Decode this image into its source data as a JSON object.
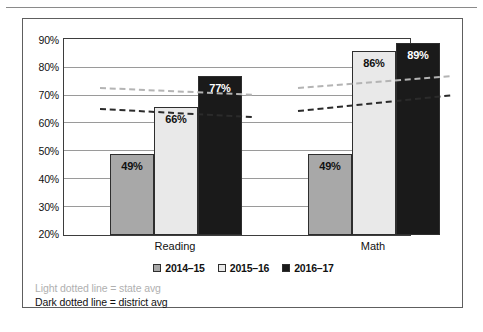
{
  "chart_data": {
    "type": "bar",
    "title": "",
    "xlabel": "",
    "ylabel": "",
    "categories": [
      "Reading",
      "Math"
    ],
    "series": [
      {
        "name": "2014–15",
        "values": [
          49,
          49
        ],
        "color": "#a8a8a8",
        "label_color": "dark"
      },
      {
        "name": "2015–16",
        "values": [
          66,
          86
        ],
        "color": "#e9e9e9",
        "label_color": "dark"
      },
      {
        "name": "2016–17",
        "values": [
          77,
          89
        ],
        "color": "#1a1a1a",
        "label_color": "light"
      }
    ],
    "value_labels": [
      [
        "49%",
        "66%",
        "77%"
      ],
      [
        "49%",
        "86%",
        "89%"
      ]
    ],
    "ylim": [
      20,
      90
    ],
    "ytick_values": [
      20,
      30,
      40,
      50,
      60,
      70,
      80,
      90
    ],
    "ytick_labels": [
      "20%",
      "30%",
      "40%",
      "50%",
      "60%",
      "70%",
      "80%",
      "90%"
    ],
    "grid": true,
    "legend_position": "bottom",
    "trend_lines": [
      {
        "name": "state avg",
        "style": "light dotted",
        "color": "#b4b4b4",
        "segments": [
          {
            "category": "Reading",
            "start": 72.7,
            "end": 70.3
          },
          {
            "category": "Math",
            "start": 72.8,
            "end": 77.0
          }
        ]
      },
      {
        "name": "district avg",
        "style": "dark dotted",
        "color": "#2b2b2b",
        "segments": [
          {
            "category": "Reading",
            "start": 65.3,
            "end": 62.4
          },
          {
            "category": "Math",
            "start": 64.6,
            "end": 70.2
          }
        ]
      }
    ]
  },
  "legend": {
    "items": [
      {
        "label": "2014–15",
        "swatch": "#a8a8a8"
      },
      {
        "label": "2015–16",
        "swatch": "#e9e9e9"
      },
      {
        "label": "2016–17",
        "swatch": "#1a1a1a"
      }
    ]
  },
  "footnotes": {
    "state": "Light dotted line = state avg",
    "district": "Dark dotted line = district avg"
  }
}
